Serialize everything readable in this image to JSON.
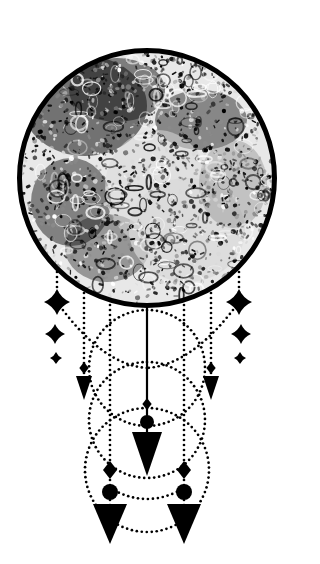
{
  "artwork": {
    "title": "Full Moon Dreamcatcher",
    "style": "black-and-white stippled linocut illustration",
    "canvas": {
      "width": 296,
      "height": 564,
      "background": "#ffffff"
    },
    "palette": {
      "ink": "#000000",
      "paper": "#ffffff",
      "texture_dark": "#111111",
      "texture_mid": "#8a8a8a",
      "texture_light": "#d8d8d8"
    }
  },
  "moon": {
    "label": "Full Moon",
    "center_x": 147,
    "center_y": 178,
    "radius": 130,
    "outline_width": 5,
    "outline_color": "#000000",
    "fill_description": "mottled crater texture, dark maria upper-left, bright highlands lower-right",
    "texture_seed_count": 320
  },
  "web": {
    "label": "Dotted Web",
    "dot_color": "#000000",
    "circles": [
      {
        "name": "upper-web-circle",
        "cx": 147,
        "cy": 368,
        "r": 58
      },
      {
        "name": "middle-web-circle",
        "cx": 147,
        "cy": 420,
        "r": 58
      },
      {
        "name": "lower-web-circle",
        "cx": 147,
        "cy": 470,
        "r": 62
      }
    ],
    "swags": [
      {
        "name": "upper-left-swag",
        "from_x": 57,
        "from_y": 302,
        "to_x": 147,
        "to_y": 368,
        "sag": 30
      },
      {
        "name": "upper-right-swag",
        "from_x": 239,
        "from_y": 302,
        "to_x": 147,
        "to_y": 368,
        "sag": 30
      },
      {
        "name": "lower-swag",
        "from_x": 110,
        "from_y": 488,
        "to_x": 184,
        "to_y": 488,
        "sag": 22
      }
    ]
  },
  "strands": [
    {
      "name": "strand-far-left",
      "x": 57,
      "top_y": 272,
      "bottom_y": 302
    },
    {
      "name": "strand-left-outer",
      "x": 84,
      "top_y": 288,
      "bottom_y": 378
    },
    {
      "name": "strand-left-inner",
      "x": 110,
      "top_y": 300,
      "bottom_y": 508
    },
    {
      "name": "strand-center",
      "x": 147,
      "top_y": 308,
      "bottom_y": 438
    },
    {
      "name": "strand-right-inner",
      "x": 184,
      "top_y": 300,
      "bottom_y": 508
    },
    {
      "name": "strand-right-outer",
      "x": 211,
      "top_y": 288,
      "bottom_y": 378
    },
    {
      "name": "strand-far-right",
      "x": 239,
      "top_y": 272,
      "bottom_y": 302
    }
  ],
  "stars": [
    {
      "name": "star-left-large",
      "cx": 57,
      "cy": 302,
      "size": 13
    },
    {
      "name": "star-left-medium",
      "cx": 55,
      "cy": 334,
      "size": 10
    },
    {
      "name": "star-left-small",
      "cx": 56,
      "cy": 358,
      "size": 6
    },
    {
      "name": "star-right-large",
      "cx": 239,
      "cy": 302,
      "size": 13
    },
    {
      "name": "star-right-medium",
      "cx": 241,
      "cy": 334,
      "size": 10
    },
    {
      "name": "star-right-small",
      "cx": 240,
      "cy": 358,
      "size": 6
    }
  ],
  "pendants": [
    {
      "name": "pendant-left-outer",
      "x": 84,
      "bead_diamond": {
        "cy": 368,
        "size": 6
      },
      "arrow": {
        "top_y": 376,
        "tip_y": 400,
        "half_width": 8
      }
    },
    {
      "name": "pendant-right-outer",
      "x": 211,
      "bead_diamond": {
        "cy": 368,
        "size": 6
      },
      "arrow": {
        "top_y": 376,
        "tip_y": 400,
        "half_width": 8
      }
    },
    {
      "name": "pendant-center",
      "x": 147,
      "bead_diamond": {
        "cy": 404,
        "size": 6
      },
      "bead_round": {
        "cy": 422,
        "r": 7
      },
      "arrow": {
        "top_y": 432,
        "tip_y": 476,
        "half_width": 15
      }
    },
    {
      "name": "pendant-bottom-left",
      "x": 110,
      "bead_diamond": {
        "cy": 470,
        "size": 9
      },
      "bead_round": {
        "cy": 492,
        "r": 8
      },
      "arrow": {
        "top_y": 504,
        "tip_y": 544,
        "half_width": 17
      }
    },
    {
      "name": "pendant-bottom-right",
      "x": 184,
      "bead_diamond": {
        "cy": 470,
        "size": 9
      },
      "bead_round": {
        "cy": 492,
        "r": 8
      },
      "arrow": {
        "top_y": 504,
        "tip_y": 544,
        "half_width": 17
      }
    }
  ]
}
